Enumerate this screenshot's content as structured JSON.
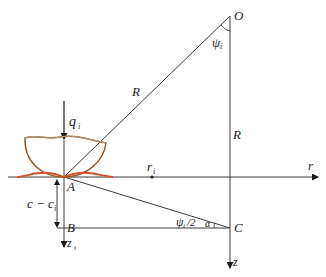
{
  "diagram": {
    "colors": {
      "line": "#3a3a3a",
      "bowl": "#8b5a2b",
      "contact": "#d2502a",
      "text": "#1a1a1a"
    },
    "points": {
      "O": "O",
      "A": "A",
      "B": "B",
      "C": "C"
    },
    "labels": {
      "R_slant": "R",
      "R_vertical": "R",
      "psi_top": "ψ",
      "psi_top_sub": "i",
      "psi_half": "ψ",
      "psi_half_sub": "i",
      "psi_half_suffix": "/2",
      "alpha": "α",
      "q": "q",
      "q_sub": "i",
      "r_i": "r",
      "r_i_sub": "i",
      "r_axis": "r",
      "z_axis": "z",
      "z_i": "z",
      "z_i_sub": "i",
      "depth": "c − c",
      "depth_sub": "i"
    }
  }
}
